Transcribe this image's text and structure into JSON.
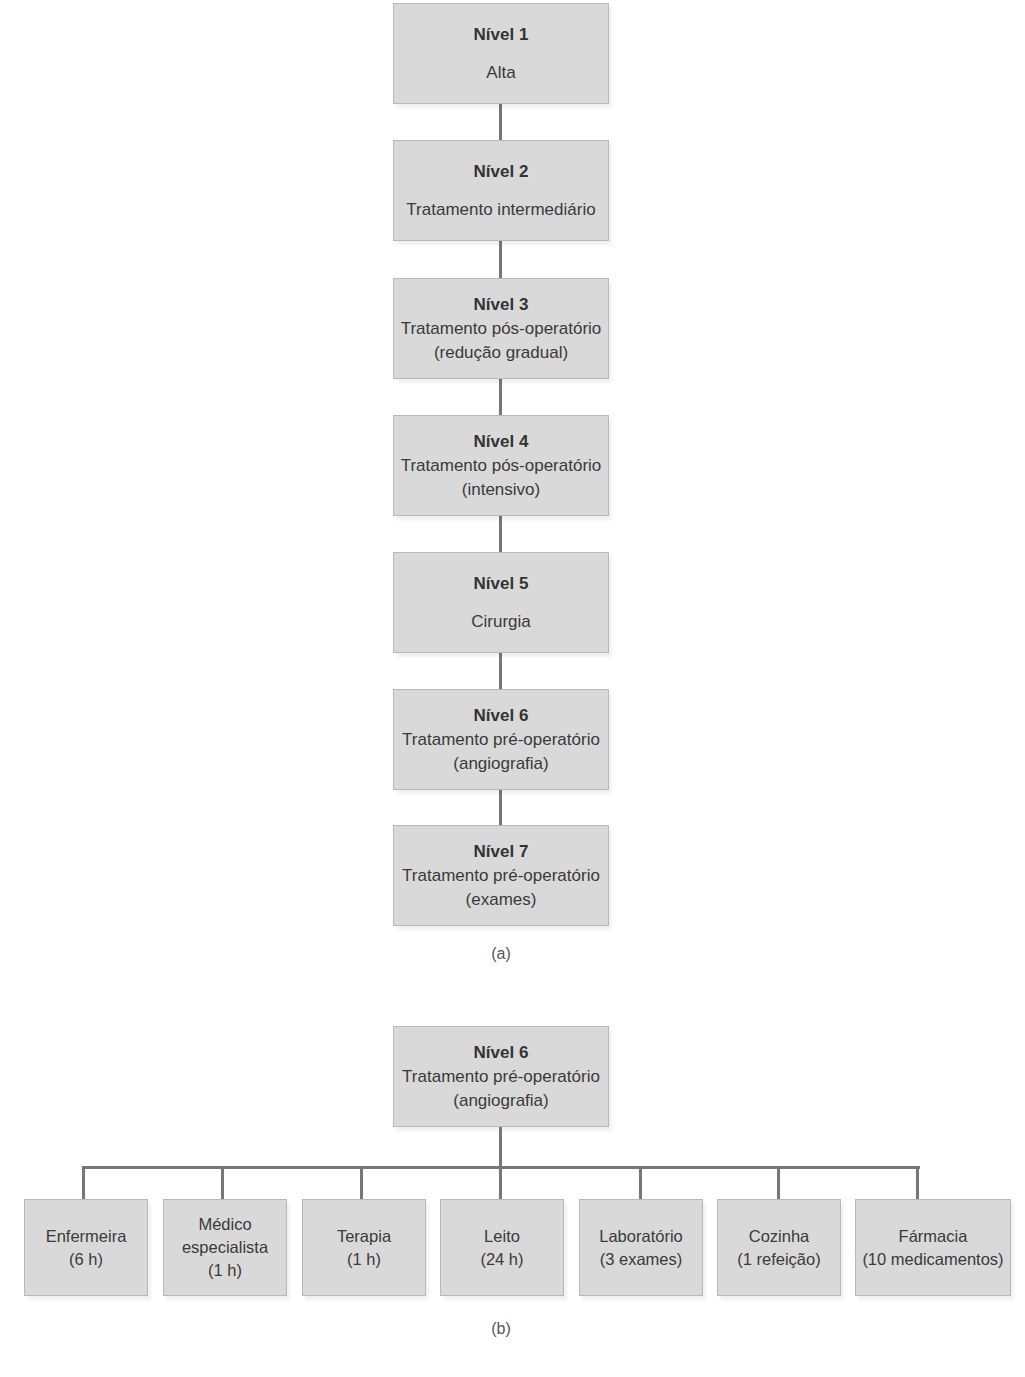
{
  "diagram_a": {
    "caption": "(a)",
    "levels": [
      {
        "title": "Nível 1",
        "lines": [
          "Alta"
        ]
      },
      {
        "title": "Nível 2",
        "lines": [
          "Tratamento intermediário"
        ]
      },
      {
        "title": "Nível 3",
        "lines": [
          "Tratamento pós-operatório",
          "(redução gradual)"
        ]
      },
      {
        "title": "Nível 4",
        "lines": [
          "Tratamento pós-operatório",
          "(intensivo)"
        ]
      },
      {
        "title": "Nível 5",
        "lines": [
          "Cirurgia"
        ]
      },
      {
        "title": "Nível 6",
        "lines": [
          "Tratamento pré-operatório",
          "(angiografia)"
        ]
      },
      {
        "title": "Nível 7",
        "lines": [
          "Tratamento pré-operatório",
          "(exames)"
        ]
      }
    ]
  },
  "diagram_b": {
    "caption": "(b)",
    "root": {
      "title": "Nível 6",
      "lines": [
        "Tratamento pré-operatório",
        "(angiografia)"
      ]
    },
    "children": [
      {
        "lines": [
          "Enfermeira",
          "(6 h)"
        ]
      },
      {
        "lines": [
          "Médico",
          "especialista",
          "(1 h)"
        ]
      },
      {
        "lines": [
          "Terapia",
          "(1 h)"
        ]
      },
      {
        "lines": [
          "Leito",
          "(24 h)"
        ]
      },
      {
        "lines": [
          "Laboratório",
          "(3 exames)"
        ]
      },
      {
        "lines": [
          "Cozinha",
          "(1 refeição)"
        ]
      },
      {
        "lines": [
          "Fármacia",
          "(10 medicamentos)"
        ]
      }
    ]
  }
}
